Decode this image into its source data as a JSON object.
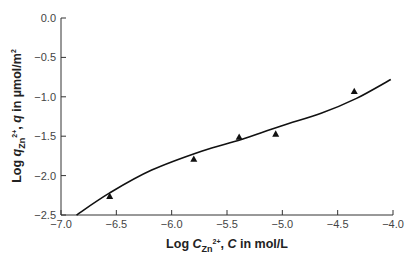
{
  "chart_data": {
    "type": "scatter",
    "title": "",
    "xlabel": "Log C_Zn2+, C in mol/L",
    "ylabel": "Log q_Zn2+, q in µmol/m2",
    "xlabel_parts": {
      "pre": "Log ",
      "var": "C",
      "sub": "Zn",
      "sup": "2+",
      "post": ", ",
      "var2": "C",
      "unit": " in mol/L"
    },
    "ylabel_parts": {
      "pre": "Log ",
      "var": "q",
      "sub": "Zn",
      "sup": "2+",
      "post": ", ",
      "var2": "q",
      "unit": " in µmol/m",
      "unit_sup": "2"
    },
    "xlim": [
      -7.0,
      -4.0
    ],
    "ylim": [
      -2.5,
      0.0
    ],
    "xticks": [
      -7.0,
      -6.5,
      -6.0,
      -5.5,
      -5.0,
      -4.5,
      -4.0
    ],
    "xtick_labels": [
      "−7.0",
      "−6.5",
      "−6.0",
      "−5.5",
      "−5.0",
      "−4.5",
      "−4.0"
    ],
    "yticks": [
      0.0,
      -0.5,
      -1.0,
      -1.5,
      -2.0,
      -2.5
    ],
    "ytick_labels": [
      "0.0",
      "−0.5",
      "−1.0",
      "−1.5",
      "−2.0",
      "−2.5"
    ],
    "grid": false,
    "legend": null,
    "series": [
      {
        "name": "Measured",
        "kind": "scatter",
        "marker": "triangle",
        "color": "#111111",
        "x": [
          -6.56,
          -5.8,
          -5.39,
          -5.06,
          -4.35
        ],
        "y": [
          -2.26,
          -1.79,
          -1.51,
          -1.47,
          -0.93
        ]
      },
      {
        "name": "Model fit",
        "kind": "line",
        "color": "#111111",
        "x": [
          -6.86,
          -6.56,
          -6.18,
          -5.73,
          -5.37,
          -5.01,
          -4.65,
          -4.33,
          -4.02
        ],
        "y": [
          -2.5,
          -2.22,
          -1.93,
          -1.69,
          -1.54,
          -1.37,
          -1.21,
          -1.02,
          -0.78
        ]
      }
    ]
  }
}
